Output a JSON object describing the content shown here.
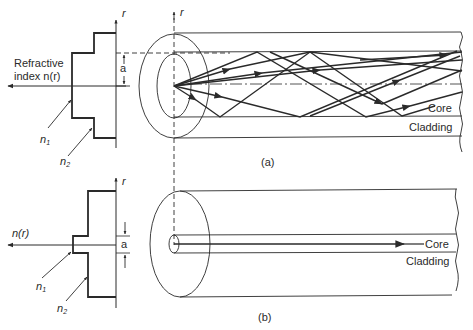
{
  "figure": {
    "colors": {
      "ink": "#2a2a2a",
      "background": "#ffffff"
    },
    "panel_a": {
      "caption": "(a)",
      "axis_r_label": "r",
      "profile_label_line1": "Refractive",
      "profile_label_line2": "index n(r)",
      "radius_label": "a",
      "n1_label": "n",
      "n1_sub": "1",
      "n2_label": "n",
      "n2_sub": "2",
      "core_label": "Core",
      "cladding_label": "Cladding"
    },
    "panel_b": {
      "caption": "(b)",
      "axis_r_label": "r",
      "profile_label": "n(r)",
      "radius_label": "a",
      "n1_label": "n",
      "n1_sub": "1",
      "n2_label": "n",
      "n2_sub": "2",
      "core_label": "Core",
      "cladding_label": "Cladding"
    }
  }
}
